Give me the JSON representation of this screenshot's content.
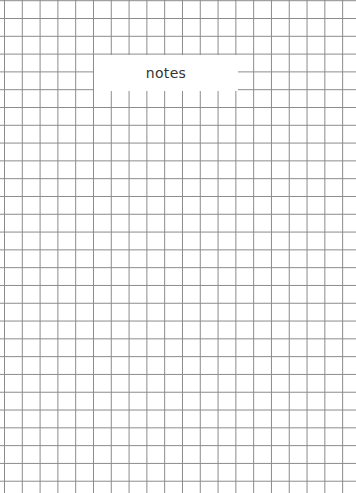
{
  "page": {
    "type": "grid-paper",
    "grid_color": "#8a8a8a",
    "background_color": "#ffffff"
  },
  "label": {
    "text": "notes"
  }
}
